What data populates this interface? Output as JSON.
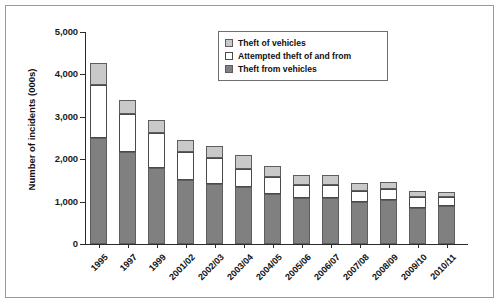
{
  "chart_data": {
    "type": "bar",
    "stacked": true,
    "title": "",
    "xlabel": "",
    "ylabel": "Number of incidents (000s)",
    "ylim": [
      0,
      5000
    ],
    "yticks": [
      0,
      1000,
      2000,
      3000,
      4000,
      5000
    ],
    "ytick_labels": [
      "0",
      "1,000",
      "2,000",
      "3,000",
      "4,000",
      "5,000"
    ],
    "grid": false,
    "legend_position": "top-right",
    "categories": [
      "1995",
      "1997",
      "1999",
      "2001/02",
      "2002/03",
      "2003/04",
      "2004/05",
      "2005/06",
      "2006/07",
      "2007/08",
      "2008/09",
      "2009/10",
      "2010/11"
    ],
    "series": [
      {
        "name": "Theft from vehicles",
        "color": "#808080",
        "values": [
          2500,
          2180,
          1800,
          1500,
          1420,
          1340,
          1180,
          1080,
          1080,
          990,
          1040,
          860,
          890
        ]
      },
      {
        "name": "Attempted theft of and from",
        "color": "#ffffff",
        "values": [
          1250,
          880,
          820,
          660,
          620,
          430,
          400,
          320,
          320,
          270,
          250,
          250,
          210
        ]
      },
      {
        "name": "Theft of vehicles",
        "color": "#c9c9c9",
        "values": [
          530,
          340,
          310,
          300,
          280,
          340,
          250,
          230,
          230,
          180,
          180,
          140,
          130
        ]
      }
    ],
    "totals": [
      4280,
      3400,
      2930,
      2460,
      2320,
      2110,
      1830,
      1630,
      1630,
      1440,
      1470,
      1250,
      1230
    ]
  },
  "legend": {
    "items": [
      {
        "label": "Theft of vehicles",
        "swatch": "s2"
      },
      {
        "label": "Attempted theft of and from",
        "swatch": "s1"
      },
      {
        "label": "Theft from vehicles",
        "swatch": "s0"
      }
    ]
  }
}
